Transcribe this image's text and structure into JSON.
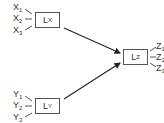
{
  "diagram": {
    "latent_nodes": [
      {
        "id": "Lx",
        "base": "L",
        "sub": "X"
      },
      {
        "id": "Ly",
        "base": "L",
        "sub": "Y"
      },
      {
        "id": "Lz",
        "base": "L",
        "sub": "Z"
      }
    ],
    "indicators_x": [
      {
        "base": "X",
        "sub": "1"
      },
      {
        "base": "X",
        "sub": "2"
      },
      {
        "base": "X",
        "sub": "3"
      }
    ],
    "indicators_y": [
      {
        "base": "Y",
        "sub": "1"
      },
      {
        "base": "Y",
        "sub": "2"
      },
      {
        "base": "Y",
        "sub": "3"
      }
    ],
    "indicators_z": [
      {
        "base": "Z",
        "sub": "1"
      },
      {
        "base": "Z",
        "sub": "2"
      },
      {
        "base": "Z",
        "sub": "3"
      }
    ],
    "edges": [
      {
        "from": "Lx",
        "to": "Lz",
        "type": "arrow"
      },
      {
        "from": "Ly",
        "to": "Lz",
        "type": "arrow"
      }
    ],
    "colors": {
      "line": "#333333",
      "box_border": "#555555",
      "text": "#333333"
    }
  }
}
